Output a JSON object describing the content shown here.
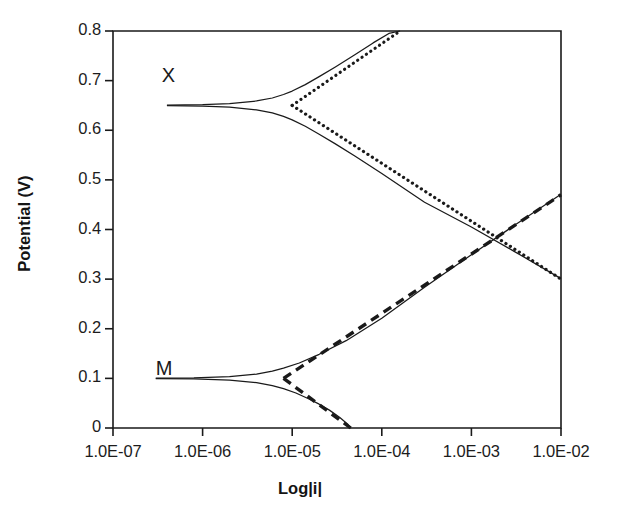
{
  "chart_data": {
    "type": "line",
    "title": "",
    "xlabel": "Log|i|",
    "ylabel": "Potential (V)",
    "x_scale": "log",
    "xlim": [
      1e-07,
      0.01
    ],
    "ylim": [
      0,
      0.8
    ],
    "grid": false,
    "legend": null,
    "x_tick_labels": [
      "1.0E-07",
      "1.0E-06",
      "1.0E-05",
      "1.0E-04",
      "1.0E-03",
      "1.0E-02"
    ],
    "x_tick_values": [
      1e-07,
      1e-06,
      1e-05,
      0.0001,
      0.001,
      0.01
    ],
    "y_tick_labels": [
      "0.8",
      "0.7",
      "0.6",
      "0.5",
      "0.4",
      "0.3",
      "0.2",
      "0.1",
      "0"
    ],
    "y_tick_values": [
      0.8,
      0.7,
      0.6,
      0.5,
      0.4,
      0.3,
      0.2,
      0.1,
      0
    ],
    "annotations": [
      {
        "text": "X",
        "x_value": 3.5e-07,
        "y_value": 0.705
      },
      {
        "text": "M",
        "x_value": 3e-07,
        "y_value": 0.115
      }
    ],
    "series": [
      {
        "name": "X-reaction-tafel-anodic",
        "style": "dotted",
        "color": "#1a1a1a",
        "points": [
          [
            1e-05,
            0.65
          ],
          [
            0.00016,
            0.8
          ]
        ]
      },
      {
        "name": "X-reaction-tafel-cathodic",
        "style": "dotted",
        "color": "#1a1a1a",
        "points": [
          [
            1e-05,
            0.65
          ],
          [
            0.01,
            0.3
          ]
        ]
      },
      {
        "name": "X-reaction-measured-polarization",
        "style": "solid",
        "color": "#1a1a1a",
        "points": [
          [
            4e-07,
            0.6505
          ],
          [
            1e-06,
            0.6515
          ],
          [
            2e-06,
            0.6535
          ],
          [
            4e-06,
            0.659
          ],
          [
            6e-06,
            0.665
          ],
          [
            8e-06,
            0.672
          ],
          [
            1e-05,
            0.679
          ],
          [
            1.4e-05,
            0.692
          ],
          [
            2e-05,
            0.708
          ],
          [
            3e-05,
            0.727
          ],
          [
            5e-05,
            0.752
          ],
          [
            8e-05,
            0.776
          ],
          [
            0.00012,
            0.795
          ],
          [
            0.00016,
            0.8
          ]
        ]
      },
      {
        "name": "X-reaction-measured-polarization-cathodic",
        "style": "solid",
        "color": "#1a1a1a",
        "points": [
          [
            4e-07,
            0.6495
          ],
          [
            1e-06,
            0.6485
          ],
          [
            2e-06,
            0.6465
          ],
          [
            4e-06,
            0.641
          ],
          [
            6e-06,
            0.635
          ],
          [
            8e-06,
            0.628
          ],
          [
            1e-05,
            0.621
          ],
          [
            1.4e-05,
            0.608
          ],
          [
            2e-05,
            0.592
          ],
          [
            3e-05,
            0.573
          ],
          [
            5e-05,
            0.548
          ],
          [
            0.0001,
            0.513
          ],
          [
            0.0003,
            0.455
          ],
          [
            0.001,
            0.405
          ],
          [
            0.003,
            0.356
          ],
          [
            0.01,
            0.301
          ]
        ]
      },
      {
        "name": "M-reaction-tafel-anodic",
        "style": "dashed",
        "color": "#1a1a1a",
        "points": [
          [
            8e-06,
            0.1
          ],
          [
            0.01,
            0.47
          ]
        ]
      },
      {
        "name": "M-reaction-tafel-cathodic",
        "style": "dashed",
        "color": "#1a1a1a",
        "points": [
          [
            8e-06,
            0.1
          ],
          [
            4.5e-05,
            0.0
          ]
        ]
      },
      {
        "name": "M-reaction-measured-polarization-anodic",
        "style": "solid",
        "color": "#1a1a1a",
        "points": [
          [
            3e-07,
            0.1005
          ],
          [
            8e-07,
            0.1012
          ],
          [
            2e-06,
            0.1035
          ],
          [
            4e-06,
            0.1085
          ],
          [
            6e-06,
            0.1145
          ],
          [
            8e-06,
            0.1205
          ],
          [
            1.2e-05,
            0.131
          ],
          [
            2e-05,
            0.1485
          ],
          [
            4e-05,
            0.176
          ],
          [
            0.0001,
            0.221
          ],
          [
            0.0003,
            0.2835
          ],
          [
            0.001,
            0.349
          ],
          [
            0.003,
            0.408
          ],
          [
            0.01,
            0.471
          ]
        ]
      },
      {
        "name": "M-reaction-measured-polarization-cathodic",
        "style": "solid",
        "color": "#1a1a1a",
        "points": [
          [
            3e-07,
            0.0995
          ],
          [
            8e-07,
            0.0988
          ],
          [
            2e-06,
            0.0965
          ],
          [
            4e-06,
            0.0915
          ],
          [
            6e-06,
            0.0855
          ],
          [
            8e-06,
            0.0795
          ],
          [
            1.1e-05,
            0.0705
          ],
          [
            1.5e-05,
            0.0595
          ],
          [
            2e-05,
            0.048
          ],
          [
            2.6e-05,
            0.036
          ],
          [
            3.4e-05,
            0.021
          ],
          [
            4.2e-05,
            0.007
          ],
          [
            4.5e-05,
            0.0
          ]
        ]
      }
    ],
    "axis_color": "#1a1a1a"
  }
}
